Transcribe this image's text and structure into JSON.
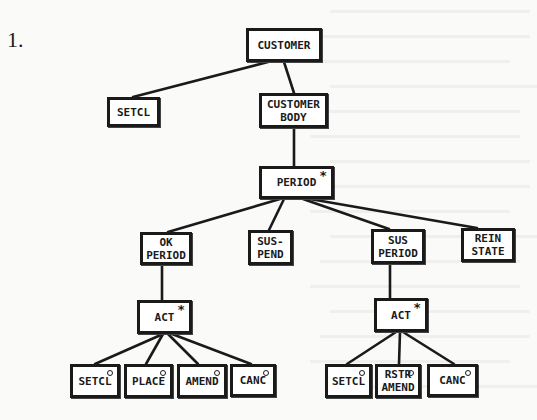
{
  "figure": {
    "number_label": "1.",
    "notation": {
      "iteration_marker": "*",
      "selection_marker": "o"
    }
  },
  "nodes": [
    {
      "id": "customer",
      "label": "CUSTOMER",
      "marker": "",
      "x": 246,
      "y": 28,
      "w": 76,
      "h": 34
    },
    {
      "id": "setcl-top",
      "label": "SETCL",
      "marker": "",
      "x": 107,
      "y": 97,
      "w": 53,
      "h": 30
    },
    {
      "id": "customer-body",
      "label": "CUSTOMER\nBODY",
      "marker": "",
      "x": 259,
      "y": 93,
      "w": 69,
      "h": 35
    },
    {
      "id": "period",
      "label": "PERIOD",
      "marker": "*",
      "x": 259,
      "y": 166,
      "w": 75,
      "h": 33
    },
    {
      "id": "ok-period",
      "label": "OK\nPERIOD",
      "marker": "",
      "x": 140,
      "y": 232,
      "w": 52,
      "h": 33
    },
    {
      "id": "sus-pend",
      "label": "SUS-\nPEND",
      "marker": "",
      "x": 248,
      "y": 230,
      "w": 45,
      "h": 35
    },
    {
      "id": "sus-period",
      "label": "SUS\nPERIOD",
      "marker": "",
      "x": 371,
      "y": 229,
      "w": 54,
      "h": 35
    },
    {
      "id": "rein-state",
      "label": "REIN\nSTATE",
      "marker": "",
      "x": 461,
      "y": 228,
      "w": 54,
      "h": 34
    },
    {
      "id": "act-left",
      "label": "ACT",
      "marker": "*",
      "x": 137,
      "y": 300,
      "w": 55,
      "h": 34
    },
    {
      "id": "act-right",
      "label": "ACT",
      "marker": "*",
      "x": 374,
      "y": 298,
      "w": 54,
      "h": 34
    },
    {
      "id": "setcl-l",
      "label": "SETCL",
      "marker": "o",
      "x": 70,
      "y": 364,
      "w": 50,
      "h": 34
    },
    {
      "id": "place-l",
      "label": "PLACE",
      "marker": "o",
      "x": 124,
      "y": 364,
      "w": 49,
      "h": 34
    },
    {
      "id": "amend-l",
      "label": "AMEND",
      "marker": "o",
      "x": 177,
      "y": 364,
      "w": 50,
      "h": 34
    },
    {
      "id": "canc-l",
      "label": "CANC",
      "marker": "o",
      "x": 230,
      "y": 364,
      "w": 46,
      "h": 33
    },
    {
      "id": "setcl-r",
      "label": "SETCL",
      "marker": "o",
      "x": 325,
      "y": 364,
      "w": 47,
      "h": 34
    },
    {
      "id": "rstr-amend-r",
      "label": "RSTR\nAMEND",
      "marker": "o",
      "x": 375,
      "y": 364,
      "w": 46,
      "h": 34
    },
    {
      "id": "canc-r",
      "label": "CANC",
      "marker": "o",
      "x": 427,
      "y": 364,
      "w": 51,
      "h": 33
    }
  ],
  "edges": [
    {
      "from": "customer",
      "to": "setcl-top",
      "x1": 268,
      "y1": 62,
      "x2": 133,
      "y2": 97
    },
    {
      "from": "customer",
      "to": "customer-body",
      "x1": 284,
      "y1": 62,
      "x2": 294,
      "y2": 93
    },
    {
      "from": "customer-body",
      "to": "period",
      "x1": 294,
      "y1": 128,
      "x2": 294,
      "y2": 166
    },
    {
      "from": "period",
      "to": "ok-period",
      "x1": 280,
      "y1": 199,
      "x2": 168,
      "y2": 232
    },
    {
      "from": "period",
      "to": "sus-pend",
      "x1": 284,
      "y1": 199,
      "x2": 269,
      "y2": 230
    },
    {
      "from": "period",
      "to": "sus-period",
      "x1": 303,
      "y1": 199,
      "x2": 389,
      "y2": 229
    },
    {
      "from": "period",
      "to": "rein-state",
      "x1": 310,
      "y1": 199,
      "x2": 477,
      "y2": 228
    },
    {
      "from": "ok-period",
      "to": "act-left",
      "x1": 162,
      "y1": 265,
      "x2": 162,
      "y2": 300
    },
    {
      "from": "sus-period",
      "to": "act-right",
      "x1": 390,
      "y1": 264,
      "x2": 390,
      "y2": 298
    },
    {
      "from": "act-left",
      "to": "setcl-l",
      "x1": 163,
      "y1": 334,
      "x2": 95,
      "y2": 364
    },
    {
      "from": "act-left",
      "to": "place-l",
      "x1": 163,
      "y1": 334,
      "x2": 146,
      "y2": 364
    },
    {
      "from": "act-left",
      "to": "amend-l",
      "x1": 168,
      "y1": 334,
      "x2": 198,
      "y2": 364
    },
    {
      "from": "act-left",
      "to": "canc-l",
      "x1": 172,
      "y1": 334,
      "x2": 251,
      "y2": 364
    },
    {
      "from": "act-right",
      "to": "setcl-r",
      "x1": 396,
      "y1": 332,
      "x2": 347,
      "y2": 364
    },
    {
      "from": "act-right",
      "to": "rstr-amend-r",
      "x1": 400,
      "y1": 332,
      "x2": 399,
      "y2": 364
    },
    {
      "from": "act-right",
      "to": "canc-r",
      "x1": 403,
      "y1": 332,
      "x2": 454,
      "y2": 364
    }
  ],
  "colors": {
    "ink": "#1a1a1a",
    "paper": "#fafaf8"
  }
}
